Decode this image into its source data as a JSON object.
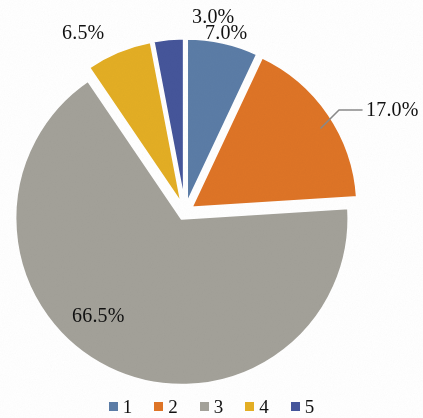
{
  "chart_data": {
    "type": "pie",
    "title": "",
    "categories": [
      "1",
      "2",
      "3",
      "4",
      "5"
    ],
    "values": [
      7.0,
      17.0,
      66.5,
      6.5,
      3.0
    ],
    "value_unit": "%",
    "data_labels": [
      "7.0%",
      "17.0%",
      "66.5%",
      "6.5%",
      "3.0%"
    ],
    "colors": [
      "#5B7CA6",
      "#DE7426",
      "#A3A199",
      "#E3AE24",
      "#45559A"
    ],
    "start_angle_deg": 0,
    "direction": "clockwise",
    "exploded": true,
    "legend_position": "bottom",
    "legend_entries": [
      "1",
      "2",
      "3",
      "4",
      "5"
    ],
    "grid": false,
    "xlabel": "",
    "ylabel": ""
  },
  "labels": {
    "slice1": "7.0%",
    "slice2": "17.0%",
    "slice3": "66.5%",
    "slice4": "6.5%",
    "slice5": "3.0%"
  },
  "legend": {
    "items": [
      {
        "label": "1",
        "color": "#5B7CA6"
      },
      {
        "label": "2",
        "color": "#DE7426"
      },
      {
        "label": "3",
        "color": "#A3A199"
      },
      {
        "label": "4",
        "color": "#E3AE24"
      },
      {
        "label": "5",
        "color": "#45559A"
      }
    ]
  }
}
